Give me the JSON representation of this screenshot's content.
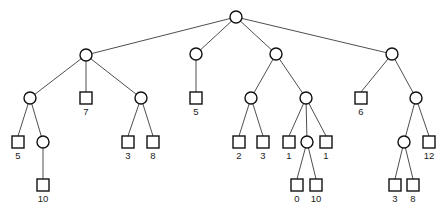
{
  "diagram": {
    "type": "game-tree",
    "style": {
      "line_color": "#3a3a3a",
      "node_stroke": "#111111",
      "background": "#ffffff"
    },
    "node_radius": 6,
    "square_size": 12,
    "nodes": [
      {
        "id": "root",
        "shape": "circle",
        "x": 236,
        "y": 17
      },
      {
        "id": "a",
        "shape": "circle",
        "x": 86,
        "y": 55,
        "parent": "root"
      },
      {
        "id": "b",
        "shape": "circle",
        "x": 196,
        "y": 54,
        "parent": "root"
      },
      {
        "id": "c",
        "shape": "circle",
        "x": 276,
        "y": 54,
        "parent": "root"
      },
      {
        "id": "d",
        "shape": "circle",
        "x": 392,
        "y": 54,
        "parent": "root"
      },
      {
        "id": "a1",
        "shape": "circle",
        "x": 30,
        "y": 98,
        "parent": "a"
      },
      {
        "id": "a2",
        "shape": "square",
        "x": 86,
        "y": 98,
        "parent": "a",
        "label": "7"
      },
      {
        "id": "a3",
        "shape": "circle",
        "x": 141,
        "y": 98,
        "parent": "a"
      },
      {
        "id": "b1",
        "shape": "square",
        "x": 196,
        "y": 98,
        "parent": "b",
        "label": "5"
      },
      {
        "id": "c1",
        "shape": "circle",
        "x": 251,
        "y": 98,
        "parent": "c"
      },
      {
        "id": "c2",
        "shape": "circle",
        "x": 306,
        "y": 98,
        "parent": "c"
      },
      {
        "id": "d1",
        "shape": "square",
        "x": 361,
        "y": 98,
        "parent": "d",
        "label": "6"
      },
      {
        "id": "d2",
        "shape": "circle",
        "x": 416,
        "y": 98,
        "parent": "d"
      },
      {
        "id": "a1a",
        "shape": "square",
        "x": 18,
        "y": 142,
        "parent": "a1",
        "label": "5"
      },
      {
        "id": "a1b",
        "shape": "circle",
        "x": 43,
        "y": 142,
        "parent": "a1"
      },
      {
        "id": "a3a",
        "shape": "square",
        "x": 128,
        "y": 142,
        "parent": "a3",
        "label": "3"
      },
      {
        "id": "a3b",
        "shape": "square",
        "x": 153,
        "y": 142,
        "parent": "a3",
        "label": "8"
      },
      {
        "id": "c1a",
        "shape": "square",
        "x": 239,
        "y": 142,
        "parent": "c1",
        "label": "2"
      },
      {
        "id": "c1b",
        "shape": "square",
        "x": 263,
        "y": 142,
        "parent": "c1",
        "label": "3"
      },
      {
        "id": "c2a",
        "shape": "square",
        "x": 289,
        "y": 142,
        "parent": "c2",
        "label": "1"
      },
      {
        "id": "c2b",
        "shape": "circle",
        "x": 307,
        "y": 142,
        "parent": "c2"
      },
      {
        "id": "c2c",
        "shape": "square",
        "x": 326,
        "y": 142,
        "parent": "c2",
        "label": "1"
      },
      {
        "id": "d2a",
        "shape": "circle",
        "x": 404,
        "y": 142,
        "parent": "d2"
      },
      {
        "id": "d2b",
        "shape": "square",
        "x": 429,
        "y": 142,
        "parent": "d2",
        "label": "12"
      },
      {
        "id": "a1b1",
        "shape": "square",
        "x": 43,
        "y": 185,
        "parent": "a1b",
        "label": "10"
      },
      {
        "id": "c2b1",
        "shape": "square",
        "x": 297,
        "y": 185,
        "parent": "c2b",
        "label": "0"
      },
      {
        "id": "c2b2",
        "shape": "square",
        "x": 316,
        "y": 185,
        "parent": "c2b",
        "label": "10"
      },
      {
        "id": "d2a1",
        "shape": "square",
        "x": 395,
        "y": 185,
        "parent": "d2a",
        "label": "3"
      },
      {
        "id": "d2a2",
        "shape": "square",
        "x": 413,
        "y": 185,
        "parent": "d2a",
        "label": "8"
      }
    ],
    "leaf_values": [
      "5",
      "10",
      "7",
      "3",
      "8",
      "5",
      "2",
      "3",
      "1",
      "0",
      "10",
      "1",
      "6",
      "3",
      "8",
      "12"
    ]
  }
}
